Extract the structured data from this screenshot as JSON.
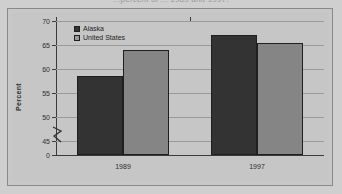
{
  "figure": {
    "clipped_title": "...percent of ... 1989 and 1997.",
    "frame_color": "#8a8a8a",
    "plot_background": "#c6c6c6"
  },
  "legend": {
    "position": "top-left-inside",
    "entries": [
      {
        "label": "Alaska",
        "color": "#333333",
        "swatch": "alaska-swatch"
      },
      {
        "label": "United States",
        "color": "#9a9a9a",
        "swatch": "united-states-swatch"
      }
    ]
  },
  "chart_data": {
    "type": "bar",
    "title": "",
    "xlabel": "",
    "ylabel": "Percent",
    "categories": [
      "1989",
      "1997"
    ],
    "series": [
      {
        "name": "Alaska",
        "color": "#333333",
        "values": [
          58.6,
          67.0
        ]
      },
      {
        "name": "United States",
        "color": "#858585",
        "values": [
          63.9,
          65.4
        ]
      }
    ],
    "ylim": [
      45,
      70
    ],
    "yticks": [
      45,
      50,
      55,
      60,
      65,
      70
    ],
    "ytick_labels": [
      "45",
      "50",
      "55",
      "60",
      "65",
      "70"
    ],
    "zero_tick_label": "0",
    "axis_break": true,
    "axis_break_note": "y-axis broken between 0 and 45",
    "grid": true,
    "grid_axis": "y",
    "legend_position": "upper left"
  }
}
